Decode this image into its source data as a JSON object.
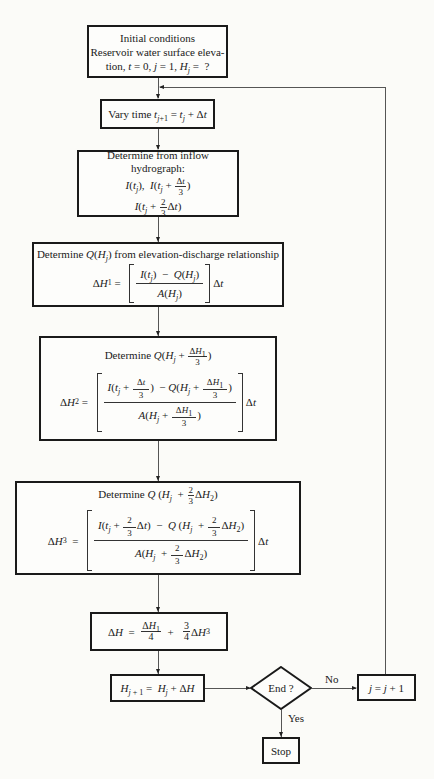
{
  "diagram": {
    "type": "flowchart",
    "nodes": {
      "initial": {
        "line1": "Initial conditions",
        "line2": "Reservoir water surface eleva-",
        "line3_prefix": "tion, ",
        "line3": "t = 0, j = 1, H_j = ?"
      },
      "vary_time": {
        "label": "Vary time",
        "formula": "t_{j+1} = t_j + Δt"
      },
      "inflow": {
        "title": "Determine from inflow hydrograph:",
        "values_line1": "I(t_j),  I(t_j + Δt/3)",
        "values_line2": "I(t_j + (2/3)Δt)"
      },
      "delta_h1": {
        "title_prefix": "Determine",
        "title_term": "Q(H_j)",
        "title_suffix": "from elevation-discharge relationship",
        "equation": "ΔH_1 = [ (I(t_j) − Q(H_j)) / A(H_j) ] Δt"
      },
      "delta_h2": {
        "title_prefix": "Determine",
        "title_term": "Q(H_j + ΔH_1/3)",
        "equation": "ΔH_2 = [ (I(t_j + Δt/3) − Q(H_j + ΔH_1/3)) / A(H_j + ΔH_1/3) ] Δt"
      },
      "delta_h3": {
        "title_prefix": "Determine",
        "title_term": "Q(H_j + (2/3)ΔH_2)",
        "equation": "ΔH_3 = [ (I(t_j + (2/3)Δt) − Q(H_j + (2/3)ΔH_2)) / A(H_j + (2/3)ΔH_2) ] Δt"
      },
      "delta_h": {
        "equation": "ΔH = ΔH_1/4 + (3/4)ΔH_3"
      },
      "update_h": {
        "equation": "H_{j+1} = H_j + ΔH"
      },
      "decision": {
        "label": "End ?"
      },
      "increment": {
        "equation": "j = j + 1"
      },
      "stop": {
        "label": "Stop"
      }
    },
    "edges": [
      {
        "from": "initial",
        "to": "vary_time"
      },
      {
        "from": "vary_time",
        "to": "inflow"
      },
      {
        "from": "inflow",
        "to": "delta_h1"
      },
      {
        "from": "delta_h1",
        "to": "delta_h2"
      },
      {
        "from": "delta_h2",
        "to": "delta_h3"
      },
      {
        "from": "delta_h3",
        "to": "delta_h"
      },
      {
        "from": "delta_h",
        "to": "update_h"
      },
      {
        "from": "update_h",
        "to": "decision"
      },
      {
        "from": "decision",
        "to": "increment",
        "label": "No"
      },
      {
        "from": "decision",
        "to": "stop",
        "label": "Yes"
      },
      {
        "from": "increment",
        "to": "vary_time",
        "label": ""
      }
    ],
    "edge_labels": {
      "no": "No",
      "yes": "Yes"
    }
  }
}
